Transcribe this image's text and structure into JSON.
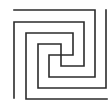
{
  "diagram": {
    "title": "",
    "width": 112,
    "height": 101,
    "background": "#ffffff",
    "stroke_color": "#2b2b2b",
    "stroke_width": 1.6,
    "paths": [
      {
        "name": "spiral-a",
        "points": [
          [
            14,
            10
          ],
          [
            95,
            10
          ],
          [
            95,
            77
          ],
          [
            49,
            77
          ],
          [
            49,
            55
          ],
          [
            73,
            55
          ],
          [
            73,
            33
          ],
          [
            26,
            33
          ],
          [
            26,
            99
          ],
          [
            107,
            99
          ]
        ]
      },
      {
        "name": "spiral-b",
        "points": [
          [
            14,
            98
          ],
          [
            14,
            22
          ],
          [
            84,
            22
          ],
          [
            84,
            66
          ],
          [
            61,
            66
          ],
          [
            61,
            44
          ],
          [
            38,
            44
          ],
          [
            38,
            88
          ],
          [
            106,
            88
          ],
          [
            106,
            10
          ]
        ]
      }
    ]
  }
}
